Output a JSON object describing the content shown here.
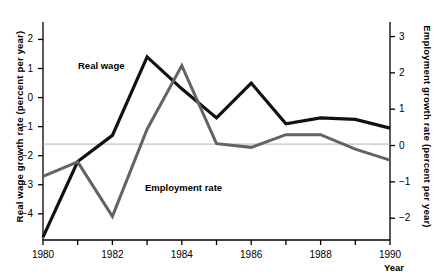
{
  "chart_data": {
    "type": "line",
    "title": "",
    "xlabel": "Year",
    "x": [
      1980,
      1981,
      1982,
      1983,
      1984,
      1985,
      1986,
      1987,
      1988,
      1989,
      1990
    ],
    "xtick_labels": [
      "1980",
      "1982",
      "1984",
      "1986",
      "1988",
      "1990"
    ],
    "xtick_values": [
      1980,
      1982,
      1984,
      1986,
      1988,
      1990
    ],
    "xlim": [
      1980,
      1990
    ],
    "grid": false,
    "legend": "inline-labels",
    "reference_line": {
      "left_axis_value": -1.6,
      "right_axis_value": 0,
      "color": "#b4b4b4"
    },
    "axes": [
      {
        "side": "left",
        "ylabel": "Real wage growth rate (percent per year)",
        "ylim": [
          -4.9,
          2.6
        ],
        "ytick_values": [
          2,
          1,
          0,
          -1,
          -2,
          -3,
          -4
        ],
        "ytick_labels": [
          "2",
          "1",
          "0",
          "−1",
          "−2",
          "−3",
          "−4"
        ]
      },
      {
        "side": "right",
        "ylabel": "Employment growth rate (percent per year)",
        "ylim": [
          -2.6,
          3.4
        ],
        "ytick_values": [
          3,
          2,
          1,
          0,
          -1,
          -2
        ],
        "ytick_labels": [
          "3",
          "2",
          "1",
          "0",
          "−1",
          "−2"
        ]
      }
    ],
    "series": [
      {
        "name": "Real wage",
        "axis": "left",
        "color": "#111111",
        "width": 3.2,
        "values": [
          -4.8,
          -2.2,
          -1.3,
          1.4,
          0.3,
          -0.7,
          0.5,
          -0.9,
          -0.7,
          -0.75,
          -1.05
        ]
      },
      {
        "name": "Employment rate",
        "axis": "right",
        "color": "#636363",
        "width": 3.0,
        "values": [
          -0.85,
          -0.45,
          -1.95,
          0.45,
          2.2,
          0.05,
          -0.05,
          0.3,
          0.3,
          -0.1,
          -0.4
        ]
      }
    ]
  },
  "labels": {
    "series_real_wage": "Real wage",
    "series_employment": "Employment rate",
    "y_left_title": "Real wage growth rate (percent per year)",
    "y_right_title": "Employment growth rate (percent per year)",
    "x_title": "Year"
  }
}
